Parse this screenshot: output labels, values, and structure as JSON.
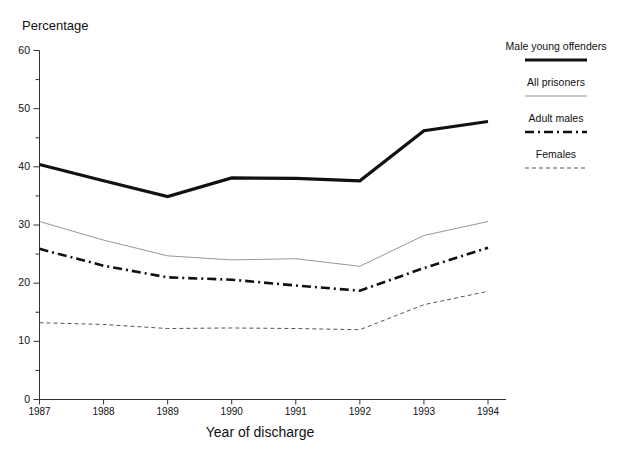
{
  "chart_data": {
    "type": "line",
    "title": "",
    "xlabel": "Year of discharge",
    "ylabel": "Percentage",
    "x": [
      1987,
      1988,
      1989,
      1990,
      1991,
      1992,
      1993,
      1994
    ],
    "xtick_labels": [
      "1987",
      "1988",
      "1989",
      "1990",
      "1991",
      "1992",
      "1993",
      "1994"
    ],
    "ytick_labels": [
      "0",
      "10",
      "20",
      "30",
      "40",
      "50",
      "60"
    ],
    "ytick_values": [
      0,
      10,
      20,
      30,
      40,
      50,
      60
    ],
    "ylim": [
      0,
      60
    ],
    "yminor_step": 5,
    "grid": false,
    "legend_position": "right",
    "series": [
      {
        "name": "Male young offenders",
        "style": "solid-thick",
        "color": "#111111",
        "width": 3.2,
        "values": [
          40.4,
          37.6,
          34.9,
          38.1,
          38.0,
          37.6,
          46.2,
          47.8
        ]
      },
      {
        "name": "All prisoners",
        "style": "solid-thin",
        "color": "#8a8a8a",
        "width": 0.9,
        "values": [
          30.6,
          27.4,
          24.7,
          24.0,
          24.2,
          22.9,
          28.2,
          30.6
        ]
      },
      {
        "name": "Adult males",
        "style": "dash-dot",
        "color": "#111111",
        "width": 2.6,
        "values": [
          25.9,
          23.0,
          21.0,
          20.6,
          19.6,
          18.7,
          22.6,
          26.1
        ]
      },
      {
        "name": "Females",
        "style": "dashed-fine",
        "color": "#555555",
        "width": 1.0,
        "values": [
          13.2,
          12.9,
          12.2,
          12.3,
          12.2,
          12.0,
          16.3,
          18.6
        ]
      }
    ]
  },
  "legend": {
    "entries": [
      {
        "label": "Male young offenders"
      },
      {
        "label": "All prisoners"
      },
      {
        "label": "Adult males"
      },
      {
        "label": "Females"
      }
    ]
  }
}
